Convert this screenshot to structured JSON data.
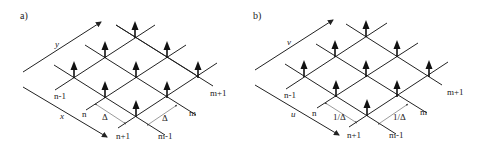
{
  "panels": [
    {
      "id": "a",
      "label": "a)",
      "axis_top": "y",
      "axis_bottom": "x",
      "row_labels": {
        "n_minus_1": "n-1",
        "n": "n",
        "n_plus_1": "n+1"
      },
      "col_labels": {
        "m_minus_1": "m-1",
        "m": "m",
        "m_plus_1": "m+1"
      },
      "spacing_label": "Δ"
    },
    {
      "id": "b",
      "label": "b)",
      "axis_top": "v",
      "axis_bottom": "u",
      "row_labels": {
        "n_minus_1": "n-1",
        "n": "n",
        "n_plus_1": "n+1"
      },
      "col_labels": {
        "m_minus_1": "m-1",
        "m": "m",
        "m_plus_1": "m+1"
      },
      "spacing_label": "1/Δ"
    }
  ],
  "colors": {
    "line": "#222222",
    "arrow": "#111111",
    "dim": "#555555"
  }
}
